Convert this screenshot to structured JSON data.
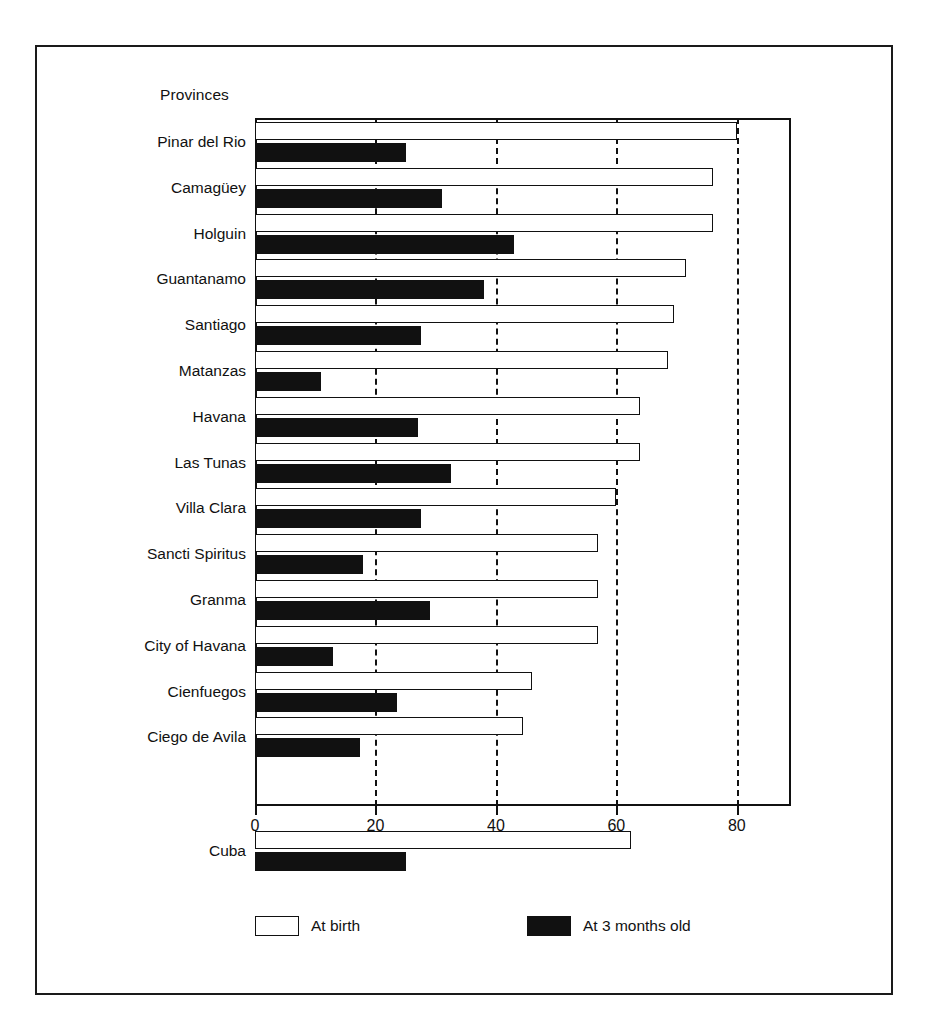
{
  "axis_title": "Provinces",
  "legend": {
    "position": "bottom",
    "items": [
      {
        "label": "At birth",
        "swatch": "open-rectangle-swatch",
        "color": "#ffffff"
      },
      {
        "label": "At 3 months old",
        "swatch": "filled-rectangle-swatch",
        "color": "#111111"
      }
    ]
  },
  "xaxis": {
    "ticks": [
      "0",
      "20",
      "40",
      "60",
      "80"
    ],
    "tick_values": [
      0,
      20,
      40,
      60,
      80
    ],
    "min": 0,
    "max": 89
  },
  "chart_data": {
    "type": "bar",
    "orientation": "horizontal",
    "title": "",
    "xlabel": "",
    "ylabel": "Provinces",
    "xlim": [
      0,
      89
    ],
    "grid": true,
    "gridlines": [
      20,
      40,
      60,
      80
    ],
    "categories": [
      "Pinar del Rio",
      "Camagüey",
      "Holguin",
      "Guantanamo",
      "Santiago",
      "Matanzas",
      "Havana",
      "Las Tunas",
      "Villa Clara",
      "Sancti Spiritus",
      "Granma",
      "City of Havana",
      "Cienfuegos",
      "Ciego de Avila",
      "Cuba"
    ],
    "series": [
      {
        "name": "At birth",
        "values": [
          80,
          76,
          76,
          71.5,
          69.5,
          68.5,
          64,
          64,
          60,
          57,
          57,
          57,
          46,
          44.5,
          62.5
        ]
      },
      {
        "name": "At 3 months old",
        "values": [
          25,
          31,
          43,
          38,
          27.5,
          11,
          27,
          32.5,
          27.5,
          18,
          29,
          13,
          23.5,
          17.5,
          25
        ]
      }
    ]
  }
}
